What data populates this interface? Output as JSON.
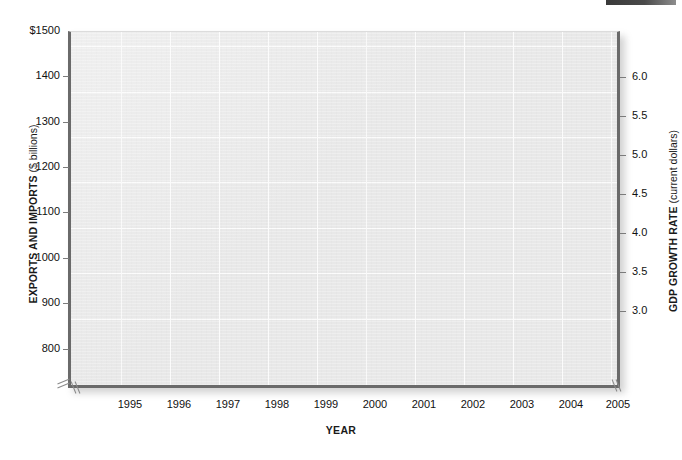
{
  "chart_data": {
    "type": "line",
    "title": "",
    "subtitle": "",
    "xlabel": "YEAR",
    "ylabel": "EXPORTS AND IMPORTS ($ billions)",
    "ylabel_right": "GDP GROWTH RATE (current dollars)",
    "ylabel_left_strong": "EXPORTS AND IMPORTS",
    "ylabel_left_light": " ($ billions)",
    "ylabel_right_strong": "GDP GROWTH RATE",
    "ylabel_right_light": " (current dollars)",
    "x": [
      1995,
      1996,
      1997,
      1998,
      1999,
      2000,
      2001,
      2002,
      2003,
      2004,
      2005
    ],
    "categories": [
      "1995",
      "1996",
      "1997",
      "1998",
      "1999",
      "2000",
      "2001",
      "2002",
      "2003",
      "2004",
      "2005"
    ],
    "series": [],
    "xlim": [
      1994.4,
      2005.0
    ],
    "ylim": [
      750,
      1500
    ],
    "ylim_right": [
      2.75,
      6.35
    ],
    "yticks": [
      800,
      900,
      1000,
      1100,
      1200,
      1300,
      1400,
      1500
    ],
    "ytick_labels": [
      "800",
      "900",
      "1000",
      "1100",
      "1200",
      "1300",
      "1400",
      "$1500"
    ],
    "yticks_right": [
      3.0,
      3.5,
      4.0,
      4.5,
      5.0,
      5.5,
      6.0
    ],
    "ytick_labels_right": [
      "3.0",
      "3.5",
      "4.0",
      "4.5",
      "5.0",
      "5.5",
      "6.0"
    ],
    "grid": true,
    "grid_color": "#fbfbfb",
    "plot_background": "#e8e8e8",
    "axis_color": "#6a6a6a",
    "legend": [],
    "legend_position": "none",
    "annotations": [],
    "axis_break_left": true,
    "axis_break_right": true,
    "note": "Plot area is empty - no data series are drawn in this figure."
  },
  "ticks": {
    "left": [
      {
        "label": "$1500",
        "y": 31
      },
      {
        "label": "1400",
        "y": 76
      },
      {
        "label": "1300",
        "y": 122
      },
      {
        "label": "1200",
        "y": 167
      },
      {
        "label": "1100",
        "y": 212
      },
      {
        "label": "1000",
        "y": 258
      },
      {
        "label": "900",
        "y": 303
      },
      {
        "label": "800",
        "y": 349
      }
    ],
    "right": [
      {
        "label": "6.0",
        "y": 77
      },
      {
        "label": "5.5",
        "y": 116
      },
      {
        "label": "5.0",
        "y": 155
      },
      {
        "label": "4.5",
        "y": 194
      },
      {
        "label": "4.0",
        "y": 233
      },
      {
        "label": "3.5",
        "y": 272
      },
      {
        "label": "3.0",
        "y": 311
      }
    ],
    "bottom": [
      {
        "label": "1995",
        "x": 130
      },
      {
        "label": "1996",
        "x": 179
      },
      {
        "label": "1997",
        "x": 228
      },
      {
        "label": "1998",
        "x": 277
      },
      {
        "label": "1999",
        "x": 326
      },
      {
        "label": "2000",
        "x": 375
      },
      {
        "label": "2001",
        "x": 424
      },
      {
        "label": "2002",
        "x": 473
      },
      {
        "label": "2003",
        "x": 522
      },
      {
        "label": "2004",
        "x": 571
      },
      {
        "label": "2005",
        "x": 618
      }
    ]
  },
  "gridlines": {
    "horizontal_y": [
      45,
      91,
      136,
      181,
      227,
      272,
      318
    ],
    "vertical_x": [
      50,
      99,
      148,
      197,
      246,
      295,
      344,
      393,
      442,
      491,
      540
    ]
  },
  "colors": {
    "plot_fill": "#e8e8e8",
    "grid": "#fbfbfb",
    "axis": "#6a6a6a",
    "text": "#111111",
    "page_background": "#ffffff",
    "artifact_bar": "#3a3a3a"
  }
}
